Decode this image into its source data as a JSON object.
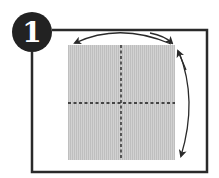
{
  "step": {
    "number": "1"
  },
  "colors": {
    "ink": "#2a2a2a",
    "paper": "#cfcfcf",
    "paper_stripe": "#bdbdbd",
    "background": "#ffffff"
  },
  "diagram": {
    "fold_lines": [
      "vertical-dashed",
      "horizontal-dashed"
    ],
    "arrows": [
      "top-curved-arrow-right-to-left",
      "right-curved-arrow-top-to-bottom"
    ]
  }
}
